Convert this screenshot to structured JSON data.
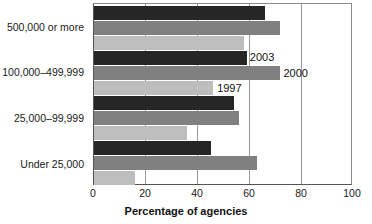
{
  "chart_data": {
    "type": "bar",
    "orientation": "horizontal",
    "title": "",
    "xlabel": "Percentage of agencies",
    "ylabel": "",
    "xlim": [
      0,
      100
    ],
    "xticks": [
      0,
      20,
      40,
      60,
      80,
      100
    ],
    "grid": true,
    "legend_position": "inline-annotations",
    "categories": [
      "500,000 or more",
      "100,000–499,999",
      "25,000–99,999",
      "Under 25,000"
    ],
    "series": [
      {
        "name": "2003",
        "color": "#262626",
        "values": [
          66,
          59,
          54,
          45
        ]
      },
      {
        "name": "2000",
        "color": "#808080",
        "values": [
          72,
          72,
          56,
          63
        ]
      },
      {
        "name": "1997",
        "color": "#bdbdbd",
        "values": [
          58,
          46,
          36,
          16
        ]
      }
    ],
    "annotations": [
      {
        "text": "2003",
        "series": "2003",
        "category": "100,000–499,999"
      },
      {
        "text": "2000",
        "series": "2000",
        "category": "100,000–499,999"
      },
      {
        "text": "1997",
        "series": "1997",
        "category": "100,000–499,999"
      }
    ]
  }
}
